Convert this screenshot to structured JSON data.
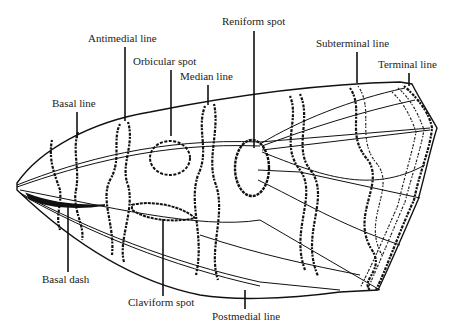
{
  "figure": {
    "labels": [
      {
        "id": "reniform-spot",
        "text": "Reniform spot",
        "x": 222,
        "y": 25,
        "leader": [
          254,
          31,
          254,
          148
        ]
      },
      {
        "id": "antimedial-line",
        "text": "Antimedial line",
        "x": 88,
        "y": 42,
        "leader": [
          125,
          47,
          125,
          121
        ]
      },
      {
        "id": "subterminal-line",
        "text": "Subterminal line",
        "x": 316,
        "y": 47,
        "leader": [
          357,
          52,
          357,
          83
        ]
      },
      {
        "id": "orbicular-spot",
        "text": "Orbicular spot",
        "x": 133,
        "y": 65,
        "leader": [
          171,
          70,
          171,
          136
        ]
      },
      {
        "id": "terminal-line",
        "text": "Terminal line",
        "x": 378,
        "y": 68,
        "leader": [
          409,
          73,
          409,
          86
        ]
      },
      {
        "id": "median-line",
        "text": "Median line",
        "x": 180,
        "y": 80,
        "leader": [
          208,
          85,
          208,
          105
        ]
      },
      {
        "id": "basal-line",
        "text": "Basal line",
        "x": 52,
        "y": 107,
        "leader": [
          77,
          112,
          77,
          138
        ]
      },
      {
        "id": "basal-dash",
        "text": "Basal dash",
        "x": 42,
        "y": 283,
        "leader": [
          68,
          207,
          68,
          272
        ]
      },
      {
        "id": "claviform-spot",
        "text": "Claviform spot",
        "x": 128,
        "y": 306,
        "leader": [
          163,
          219,
          163,
          296
        ]
      },
      {
        "id": "postmedial-line",
        "text": "Postmedial line",
        "x": 212,
        "y": 320,
        "leader": [
          245,
          290,
          245,
          309
        ]
      }
    ]
  }
}
